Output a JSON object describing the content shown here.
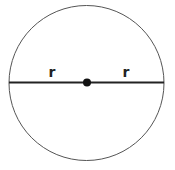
{
  "diagram": {
    "shape": "circle",
    "colors": {
      "outline": "#555555",
      "diameter": "#222222",
      "center_dot": "#111111",
      "label": "#222222"
    },
    "labels": {
      "left_radius": "r",
      "right_radius": "r"
    }
  }
}
